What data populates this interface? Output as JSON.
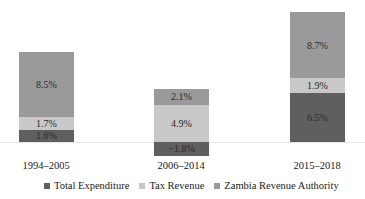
{
  "chart_data": {
    "type": "bar",
    "stacked": true,
    "title": "",
    "xlabel": "",
    "ylabel": "",
    "categories": [
      "1994–2005",
      "2006–2014",
      "2015–2018"
    ],
    "series": [
      {
        "name": "Total Expenditure",
        "color": "#5f5f5f",
        "values": [
          1.6,
          -1.8,
          6.5
        ],
        "labels": [
          "1.6%",
          "−1.8%",
          "6.5%"
        ]
      },
      {
        "name": "Tax Revenue",
        "color": "#c8c8c8",
        "values": [
          1.7,
          4.9,
          1.9
        ],
        "labels": [
          "1.7%",
          "4.9%",
          "1.9%"
        ]
      },
      {
        "name": "Zambia Revenue Authority",
        "color": "#9a9a9a",
        "values": [
          8.5,
          2.1,
          8.7
        ],
        "labels": [
          "8.5%",
          "2.1%",
          "8.7%"
        ]
      }
    ],
    "grid": false,
    "legend_position": "bottom",
    "baseline": 0
  },
  "legend": {
    "items": [
      {
        "label": "Total Expenditure",
        "color": "#5f5f5f"
      },
      {
        "label": "Tax Revenue",
        "color": "#c8c8c8"
      },
      {
        "label": "Zambia Revenue Authority",
        "color": "#9a9a9a"
      }
    ]
  }
}
